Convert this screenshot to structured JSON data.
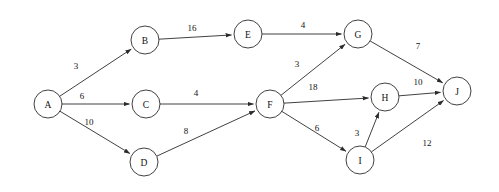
{
  "diagram": {
    "type": "directed-weighted-graph",
    "canvas": {
      "width": 499,
      "height": 192
    },
    "style": {
      "background_color": "#ffffff",
      "stroke_color": "#2b2b2b",
      "node_fill": "#ffffff",
      "text_color": "#111111",
      "node_radius": 14
    },
    "nodes": [
      {
        "id": "A",
        "label": "A",
        "x": 48,
        "y": 104
      },
      {
        "id": "B",
        "label": "B",
        "x": 145,
        "y": 40
      },
      {
        "id": "C",
        "label": "C",
        "x": 146,
        "y": 104
      },
      {
        "id": "D",
        "label": "D",
        "x": 144,
        "y": 162
      },
      {
        "id": "E",
        "label": "E",
        "x": 248,
        "y": 34
      },
      {
        "id": "F",
        "label": "F",
        "x": 270,
        "y": 104
      },
      {
        "id": "G",
        "label": "G",
        "x": 358,
        "y": 34
      },
      {
        "id": "H",
        "label": "H",
        "x": 385,
        "y": 97
      },
      {
        "id": "I",
        "label": "I",
        "x": 360,
        "y": 160
      },
      {
        "id": "J",
        "label": "J",
        "x": 457,
        "y": 91
      }
    ],
    "edges": [
      {
        "from": "A",
        "to": "B",
        "weight": "3",
        "lx": 76,
        "ly": 66
      },
      {
        "from": "A",
        "to": "C",
        "weight": "6",
        "lx": 82,
        "ly": 96
      },
      {
        "from": "A",
        "to": "D",
        "weight": "10",
        "lx": 89,
        "ly": 122
      },
      {
        "from": "B",
        "to": "E",
        "weight": "16",
        "lx": 192,
        "ly": 28
      },
      {
        "from": "C",
        "to": "F",
        "weight": "4",
        "lx": 196,
        "ly": 93
      },
      {
        "from": "D",
        "to": "F",
        "weight": "8",
        "lx": 186,
        "ly": 131
      },
      {
        "from": "E",
        "to": "G",
        "weight": "4",
        "lx": 303,
        "ly": 25
      },
      {
        "from": "F",
        "to": "G",
        "weight": "3",
        "lx": 297,
        "ly": 64
      },
      {
        "from": "F",
        "to": "H",
        "weight": "18",
        "lx": 313,
        "ly": 87
      },
      {
        "from": "F",
        "to": "I",
        "weight": "6",
        "lx": 317,
        "ly": 128
      },
      {
        "from": "G",
        "to": "J",
        "weight": "7",
        "lx": 418,
        "ly": 46
      },
      {
        "from": "H",
        "to": "J",
        "weight": "10",
        "lx": 418,
        "ly": 82
      },
      {
        "from": "I",
        "to": "H",
        "weight": "3",
        "lx": 357,
        "ly": 133
      },
      {
        "from": "I",
        "to": "J",
        "weight": "12",
        "lx": 427,
        "ly": 143
      }
    ]
  }
}
